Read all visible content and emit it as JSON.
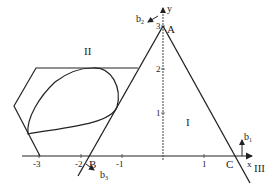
{
  "diagram": {
    "type": "geometry-plot",
    "axes": {
      "x_label": "x",
      "y_label": "y",
      "x_ticks": [
        "-3",
        "-2",
        "-1",
        "1"
      ],
      "y_ticks": [
        "1",
        "2",
        "3"
      ]
    },
    "points": {
      "A": "A",
      "B": "B",
      "C": "C"
    },
    "vectors": {
      "b1": "b",
      "b1_sub": "1",
      "b2": "b",
      "b2_sub": "2",
      "b3": "b",
      "b3_sub": "3"
    },
    "regions": {
      "r1": "I",
      "r2": "II",
      "r3": "III"
    },
    "shapes": [
      "triangle ABC",
      "hexagon",
      "inscribed ellipse"
    ]
  }
}
